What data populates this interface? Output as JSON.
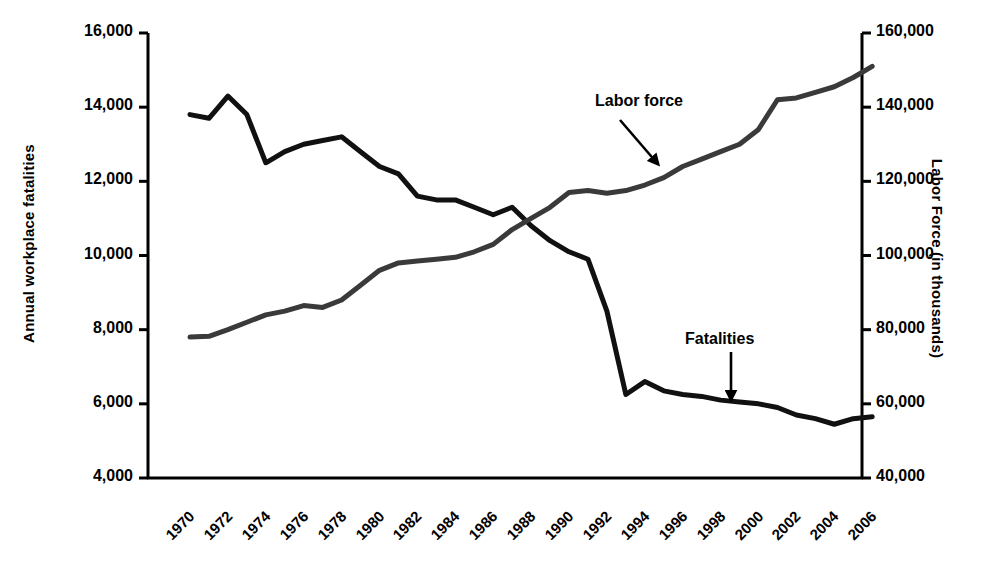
{
  "chart_data": {
    "type": "line",
    "title": "",
    "xlabel": "",
    "ylabel": "Annual workplace fatalities",
    "y2label": "Labor Force (in thousands)",
    "grid": false,
    "legend_position": "inline-annotations",
    "xlim": [
      1969,
      2006
    ],
    "ylim": [
      4000,
      16000
    ],
    "y2lim": [
      40000,
      160000
    ],
    "yticks": [
      "4,000",
      "6,000",
      "8,000",
      "10,000",
      "12,000",
      "14,000",
      "16,000"
    ],
    "ytick_values": [
      4000,
      6000,
      8000,
      10000,
      12000,
      14000,
      16000
    ],
    "y2ticks": [
      "40,000",
      "60,000",
      "80,000",
      "100,000",
      "120,000",
      "140,000",
      "160,000"
    ],
    "y2tick_values": [
      40000,
      60000,
      80000,
      100000,
      120000,
      140000,
      160000
    ],
    "xticks": [
      "1970",
      "1972",
      "1974",
      "1976",
      "1978",
      "1980",
      "1982",
      "1984",
      "1986",
      "1988",
      "1990",
      "1992",
      "1994",
      "1996",
      "1998",
      "2000",
      "2002",
      "2004",
      "2006"
    ],
    "x": [
      1970,
      1971,
      1972,
      1973,
      1974,
      1975,
      1976,
      1977,
      1978,
      1979,
      1980,
      1981,
      1982,
      1983,
      1984,
      1985,
      1986,
      1987,
      1988,
      1989,
      1990,
      1991,
      1992,
      1993,
      1994,
      1995,
      1996,
      1997,
      1998,
      1999,
      2000,
      2001,
      2002,
      2003,
      2004,
      2005,
      2006
    ],
    "series": [
      {
        "name": "Fatalities",
        "axis": "left",
        "color": "#111111",
        "values": [
          13800,
          13700,
          14300,
          13800,
          12500,
          12800,
          13000,
          13100,
          13200,
          12800,
          12400,
          12200,
          11600,
          11500,
          11500,
          11300,
          11100,
          11300,
          10800,
          10400,
          10100,
          9900,
          8500,
          6250,
          6600,
          6350,
          6250,
          6200,
          6100,
          6050,
          6000,
          5900,
          5700,
          5600,
          5450,
          5600,
          5650
        ]
      },
      {
        "name": "Labor force",
        "axis": "right",
        "color": "#3a3a3a",
        "values": [
          78000,
          78200,
          80000,
          82000,
          84000,
          85000,
          86500,
          86000,
          88000,
          92000,
          96000,
          98000,
          98500,
          99000,
          99500,
          101000,
          103000,
          107000,
          110000,
          113000,
          117000,
          117500,
          116800,
          117500,
          119000,
          121000,
          124000,
          126000,
          128000,
          130000,
          134000,
          142000,
          142500,
          144000,
          145500,
          148000,
          151000
        ]
      }
    ],
    "annotations": [
      {
        "text": "Labor force",
        "target_series": "Labor force"
      },
      {
        "text": "Fatalities",
        "target_series": "Fatalities"
      }
    ]
  },
  "axes": {
    "left_title": "Annual workplace fatalities",
    "right_title": "Labor Force (in thousands)"
  }
}
